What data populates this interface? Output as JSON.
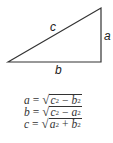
{
  "diagram": {
    "type": "right-triangle",
    "vertices": {
      "bottom_left": [
        8,
        62
      ],
      "top_right": [
        101,
        8
      ],
      "bottom_right": [
        101,
        62
      ]
    },
    "stroke_color": "#333333",
    "labels": {
      "hypotenuse": "c",
      "vertical_leg": "a",
      "horizontal_leg": "b"
    }
  },
  "formulas": [
    {
      "lhs": "a",
      "eq": "=",
      "radicand": [
        {
          "v": "c",
          "p": "2"
        },
        {
          "op": "−"
        },
        {
          "v": "b",
          "p": "2"
        }
      ]
    },
    {
      "lhs": "b",
      "eq": "=",
      "radicand": [
        {
          "v": "c",
          "p": "2"
        },
        {
          "op": "−"
        },
        {
          "v": "a",
          "p": "2"
        }
      ]
    },
    {
      "lhs": "c",
      "eq": "=",
      "radicand": [
        {
          "v": "a",
          "p": "2"
        },
        {
          "op": "+"
        },
        {
          "v": "b",
          "p": "2"
        }
      ]
    }
  ],
  "radical_symbol": "√"
}
